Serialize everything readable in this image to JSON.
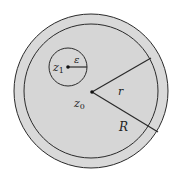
{
  "diagram": {
    "colors": {
      "background": "#ffffff",
      "fill": "#d9d9d9",
      "stroke": "#2a2a2a"
    },
    "outer_circle": {
      "cx": 91,
      "cy": 91,
      "r": 77
    },
    "inner_circle": {
      "cx": 91,
      "cy": 91,
      "r": 67
    },
    "small_circle": {
      "cx": 68,
      "cy": 67,
      "r": 19
    },
    "points": {
      "z0": {
        "label": "z",
        "sub": "0",
        "x": 92,
        "y": 92
      },
      "z1": {
        "label": "z",
        "sub": "1",
        "x": 68,
        "y": 67
      }
    },
    "segments": {
      "epsilon": {
        "label": "ε",
        "x1": 68,
        "y1": 67,
        "x2": 87,
        "y2": 67
      },
      "r": {
        "label": "r",
        "x1": 92,
        "y1": 92,
        "x2": 151,
        "y2": 58
      },
      "R": {
        "label": "R",
        "x1": 92,
        "y1": 92,
        "x2": 158,
        "y2": 132
      }
    }
  }
}
